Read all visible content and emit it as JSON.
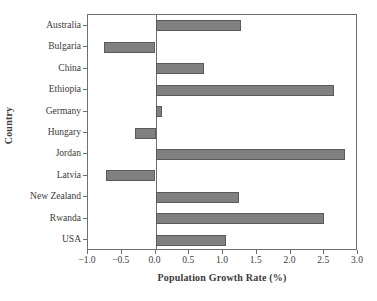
{
  "chart_data": {
    "type": "bar",
    "orientation": "horizontal",
    "title": "",
    "xlabel": "Population Growth Rate (%)",
    "ylabel": "Country",
    "categories": [
      "Australia",
      "Bulgaria",
      "China",
      "Ethiopia",
      "Germany",
      "Hungary",
      "Jordan",
      "Latvia",
      "New Zealand",
      "Rwanda",
      "USA"
    ],
    "values": [
      1.27,
      -0.77,
      0.72,
      2.65,
      0.09,
      -0.3,
      2.8,
      -0.74,
      1.24,
      2.5,
      1.05
    ],
    "xlim": [
      -1.0,
      3.0
    ],
    "xticks": [
      -1.0,
      -0.5,
      0.0,
      0.5,
      1.0,
      1.5,
      2.0,
      2.5,
      3.0
    ],
    "xtick_labels": [
      "−1.0",
      "−0.5",
      "0.0",
      "0.5",
      "1.0",
      "1.5",
      "2.0",
      "2.5",
      "3.0"
    ],
    "grid": false,
    "legend": false,
    "bar_color": "#808080",
    "bar_edge_color": "#5a5a5a",
    "axis_color": "#6f6f6f",
    "text_color": "#3a3a3a",
    "background": "#ffffff"
  }
}
